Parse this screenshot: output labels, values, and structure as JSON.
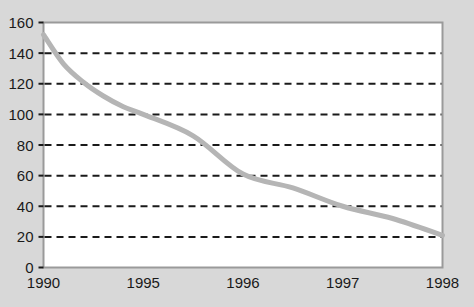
{
  "chart_data": {
    "type": "line",
    "title": "",
    "subtitle": "",
    "xlabel": "",
    "ylabel": "",
    "categories": [
      "1990",
      "1995",
      "1996",
      "1997",
      "1998"
    ],
    "x_tick_labels": [
      "1990",
      "1995",
      "1996",
      "1997",
      "1998"
    ],
    "y_tick_labels": [
      "0",
      "20",
      "40",
      "60",
      "80",
      "100",
      "120",
      "140",
      "160"
    ],
    "y_ticks": [
      0,
      20,
      40,
      60,
      80,
      100,
      120,
      140,
      160
    ],
    "ylim": [
      0,
      160
    ],
    "grid": "horizontal-dashed",
    "legend": "none",
    "series": [
      {
        "name": "series-1",
        "color": "#b5b5b5",
        "values": [
          152,
          100,
          61,
          40,
          21
        ],
        "points": [
          {
            "x": "1990",
            "y": 152
          },
          {
            "x": "1991",
            "y": 133
          },
          {
            "x": "1992",
            "y": 121
          },
          {
            "x": "1993",
            "y": 112
          },
          {
            "x": "1994",
            "y": 105
          },
          {
            "x": "1995",
            "y": 100
          },
          {
            "x": "1995.5",
            "y": 86
          },
          {
            "x": "1996",
            "y": 61
          },
          {
            "x": "1996.5",
            "y": 52
          },
          {
            "x": "1997",
            "y": 40
          },
          {
            "x": "1997.5",
            "y": 32
          },
          {
            "x": "1998",
            "y": 21
          }
        ]
      }
    ],
    "annotations": []
  },
  "colors": {
    "page_background": "#d8d8d8",
    "plot_background": "#ffffff",
    "plot_border": "#9a9a9a",
    "gridline": "#1a1a1a",
    "line_series": "#b5b5b5",
    "tick_text": "#1a1a1a"
  },
  "axes": {
    "y_axis_name": "value-axis",
    "x_axis_name": "year-axis",
    "y_tick_count": 9,
    "x_tick_count": 5
  }
}
